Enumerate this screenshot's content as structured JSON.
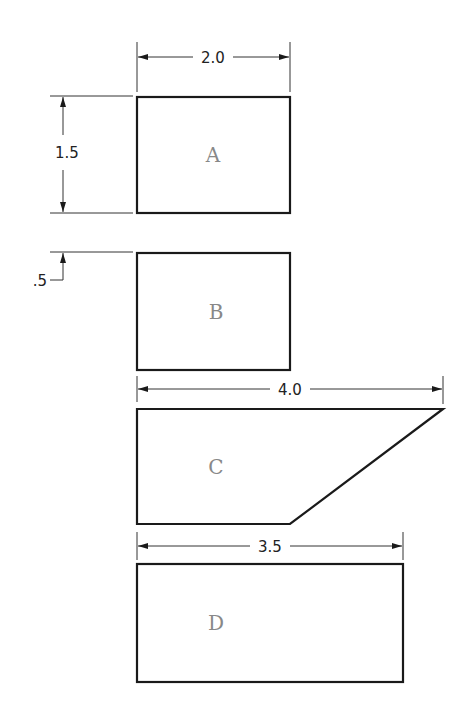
{
  "diagram": {
    "shapes": [
      {
        "id": "A",
        "label": "A",
        "type": "rectangle"
      },
      {
        "id": "B",
        "label": "B",
        "type": "rectangle"
      },
      {
        "id": "C",
        "label": "C",
        "type": "trapezoid"
      },
      {
        "id": "D",
        "label": "D",
        "type": "rectangle"
      }
    ],
    "dimensions": {
      "a_width": "2.0",
      "a_height": "1.5",
      "gap_ab": ".5",
      "c_width": "4.0",
      "d_width": "3.5"
    },
    "colors": {
      "line": "#1a1a1a",
      "label": "#888888",
      "background": "#ffffff"
    }
  }
}
